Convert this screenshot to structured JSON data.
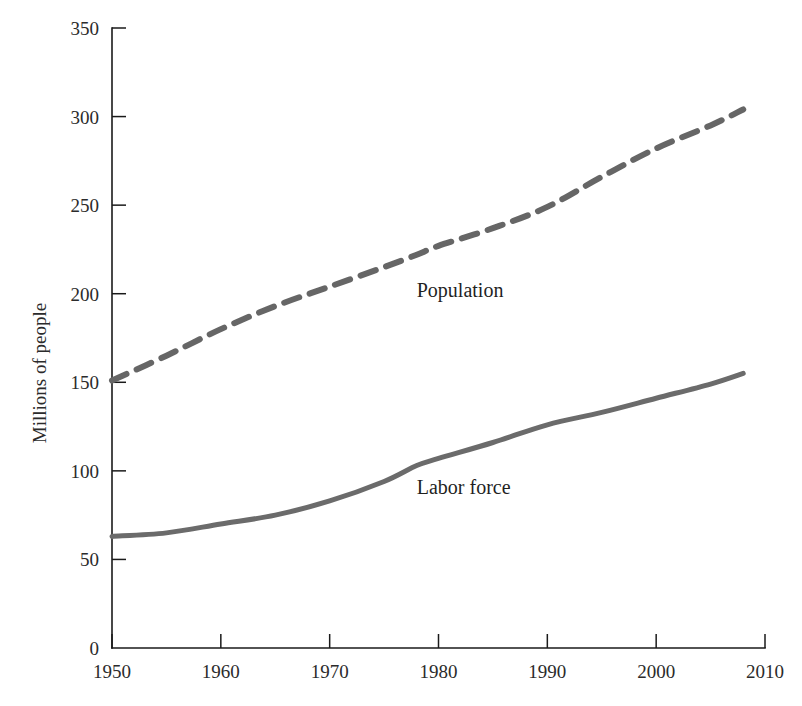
{
  "chart_data": {
    "type": "line",
    "title": "",
    "xlabel": "",
    "ylabel": "Millions of people",
    "xlim": [
      1950,
      2010
    ],
    "ylim": [
      0,
      350
    ],
    "grid": false,
    "legend_position": "inline-annotation",
    "x_ticks": [
      1950,
      1960,
      1970,
      1980,
      1990,
      2000,
      2010
    ],
    "y_ticks": [
      0,
      50,
      100,
      150,
      200,
      250,
      300,
      350
    ],
    "x": [
      1950,
      1955,
      1960,
      1965,
      1970,
      1975,
      1978,
      1980,
      1985,
      1990,
      1995,
      2000,
      2005,
      2008
    ],
    "series": [
      {
        "name": "Population",
        "label": "Population",
        "style": "dashed",
        "color": "#666666",
        "width": 6,
        "dash": "16 11",
        "label_x": 1978,
        "label_y": 198,
        "values": [
          151,
          165,
          180,
          193,
          204,
          215,
          222,
          227,
          237,
          249,
          266,
          282,
          295,
          304
        ]
      },
      {
        "name": "Labor force",
        "label": "Labor force",
        "style": "solid",
        "color": "#6b6b6b",
        "width": 5,
        "dash": "",
        "label_x": 1978,
        "label_y": 87,
        "values": [
          63,
          65,
          70,
          75,
          83,
          94,
          103,
          107,
          116,
          126,
          133,
          141,
          149,
          155
        ]
      }
    ]
  },
  "axes": {
    "y_label": "Millions of people"
  },
  "icons": {
    "dashed-line-swatch": "dashed-line-icon",
    "solid-line-swatch": "solid-line-icon"
  }
}
